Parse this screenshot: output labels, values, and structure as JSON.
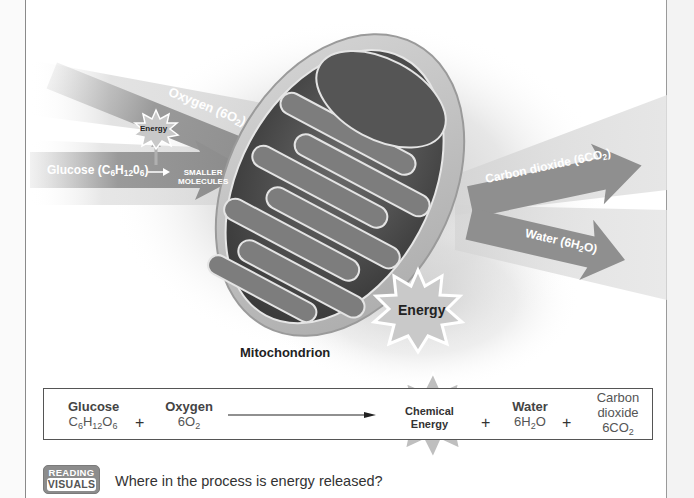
{
  "diagram": {
    "organelle_label": "Mitochondrion",
    "inputs": {
      "oxygen_arrow": {
        "name": "Oxygen",
        "formula_prefix": "(6O",
        "formula_sub": "2",
        "formula_suffix": ")"
      },
      "glucose_arrow": {
        "name": "Glucose",
        "formula_prefix": "(C",
        "sub1": "6",
        "mid1": "H",
        "sub2": "12",
        "mid2": "0",
        "sub3": "6",
        "formula_suffix": ")"
      },
      "small_energy_star": "Energy",
      "smaller_molecules_line1": "SMALLER",
      "smaller_molecules_line2": "MOLECULES"
    },
    "outputs": {
      "carbon_dioxide_arrow": {
        "name": "Carbon dioxide",
        "formula_prefix": "(6CO",
        "formula_sub": "2",
        "formula_suffix": ")"
      },
      "water_arrow": {
        "name": "Water",
        "formula_prefix": "(6H",
        "formula_sub": "2",
        "formula_suffix": "O)"
      },
      "energy_star": "Energy"
    }
  },
  "equation": {
    "reactants": [
      {
        "name": "Glucose",
        "formula": "C6H12O6"
      },
      {
        "name": "Oxygen",
        "formula": "6O2"
      }
    ],
    "plus": "+",
    "product_star": {
      "line1": "Chemical",
      "line2": "Energy"
    },
    "products": [
      {
        "name": "Water",
        "formula": "6H2O"
      },
      {
        "name_line1": "Carbon",
        "name_line2": "dioxide",
        "formula": "6CO2"
      }
    ]
  },
  "reading_visuals": {
    "badge_top": "READING",
    "badge_bottom": "VISUALS",
    "question": "Where in the process is energy released?"
  },
  "colors": {
    "arrow_gray": "#8f8f8f",
    "band_gray": "#d9d9d9",
    "membrane_dark": "#4a4a4a",
    "star_fill": "#bdbdbd"
  }
}
